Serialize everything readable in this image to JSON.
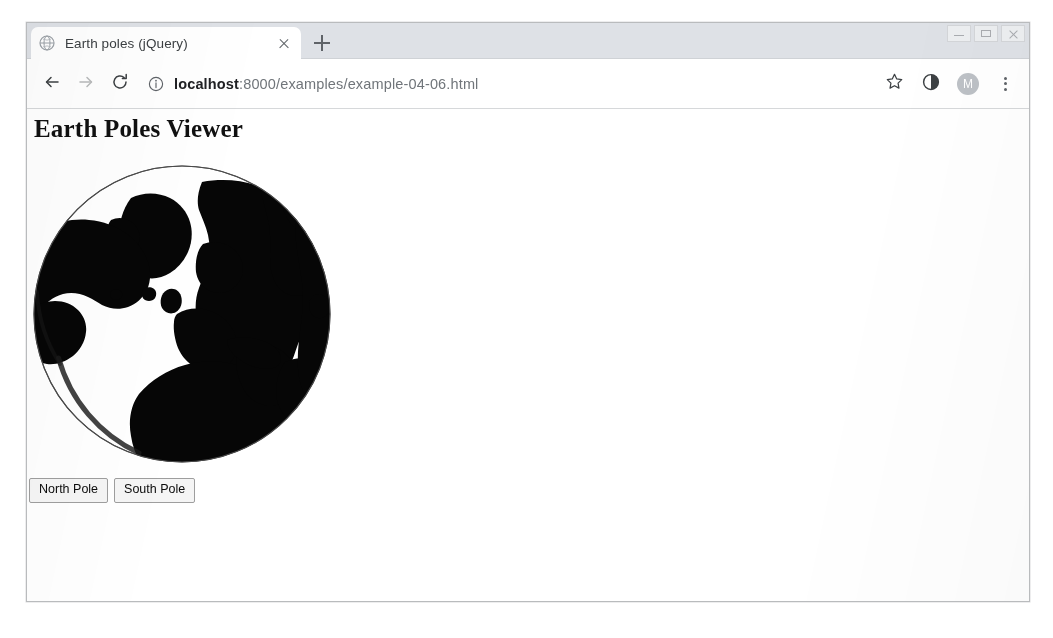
{
  "window": {
    "controls": [
      {
        "name": "minimize",
        "label": "–"
      },
      {
        "name": "maximize",
        "label": "□"
      },
      {
        "name": "close",
        "label": "✕"
      }
    ]
  },
  "tabstrip": {
    "tabs": [
      {
        "title": "Earth poles (jQuery)",
        "favicon": "globe-icon",
        "active": true,
        "close_label": "×"
      }
    ],
    "new_tab_label": "+",
    "new_tab_icon": "plus-icon"
  },
  "toolbar": {
    "back_icon": "arrow-left-icon",
    "forward_icon": "arrow-right-icon",
    "reload_icon": "reload-icon",
    "site_info_icon": "info-circle-icon",
    "url_host": "localhost",
    "url_path": ":8000/examples/example-04-06.html",
    "url_full": "localhost:8000/examples/example-04-06.html",
    "bookmark_icon": "star-icon",
    "extension_icon": "contrast-half-circle-icon",
    "profile_initial": "M",
    "profile_icon": "avatar-icon",
    "menu_icon": "kebab-menu-icon"
  },
  "page": {
    "heading": "Earth Poles Viewer",
    "globe": {
      "name": "orthographic-globe",
      "projection": "orthographic",
      "view": "north-pole",
      "land_color": "#000000",
      "ocean_color": "#ffffff",
      "outline_color": "#4a4a4a",
      "center_x": 155,
      "center_y": 152,
      "radius": 148
    },
    "buttons": [
      {
        "name": "north-pole-button",
        "label": "North Pole"
      },
      {
        "name": "south-pole-button",
        "label": "South Pole"
      }
    ]
  }
}
